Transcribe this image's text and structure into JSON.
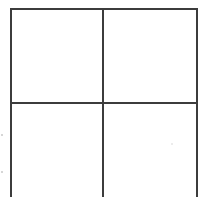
{
  "diagram": {
    "type": "grid",
    "rows": 2,
    "columns": 2,
    "line_color": "#3c3c3c",
    "background_color": "#ffffff",
    "cells": [
      {
        "row": 1,
        "column": 1,
        "content": ""
      },
      {
        "row": 1,
        "column": 2,
        "content": ""
      },
      {
        "row": 2,
        "column": 1,
        "content": ""
      },
      {
        "row": 2,
        "column": 2,
        "content": ""
      }
    ]
  }
}
